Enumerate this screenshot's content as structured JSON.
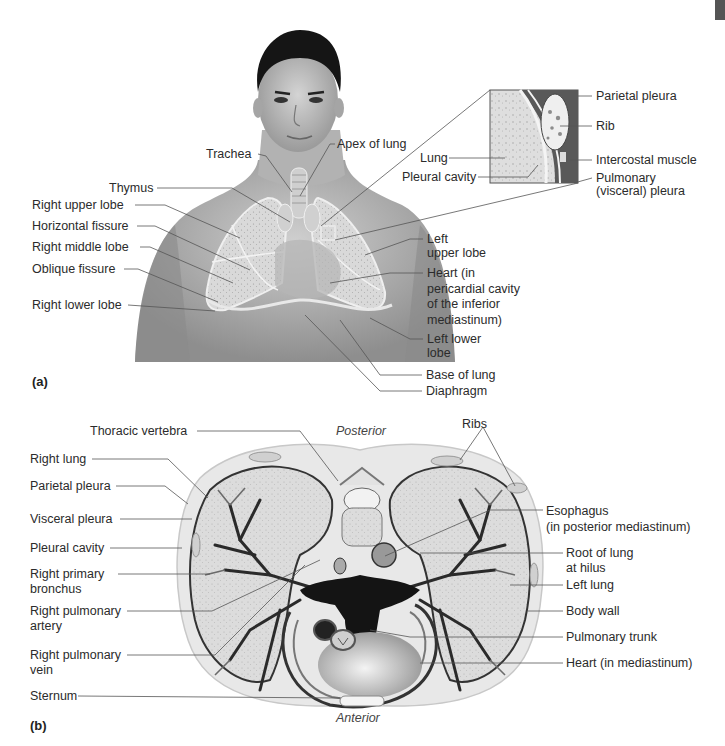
{
  "figure": {
    "panel_a": {
      "tag": "(a)",
      "labels_left": [
        {
          "id": "trachea",
          "text": "Trachea"
        },
        {
          "id": "thymus",
          "text": "Thymus"
        },
        {
          "id": "right_upper_lobe",
          "text": "Right upper lobe"
        },
        {
          "id": "horizontal_fissure",
          "text": "Horizontal fissure"
        },
        {
          "id": "right_middle_lobe",
          "text": "Right middle lobe"
        },
        {
          "id": "oblique_fissure",
          "text": "Oblique fissure"
        },
        {
          "id": "right_lower_lobe",
          "text": "Right lower lobe"
        }
      ],
      "labels_right": [
        {
          "id": "apex_of_lung",
          "text": "Apex of lung"
        },
        {
          "id": "left_upper_lobe",
          "lines": [
            "Left",
            "upper lobe"
          ]
        },
        {
          "id": "heart",
          "lines": [
            "Heart (in",
            "pericardial cavity",
            "of the inferior",
            "mediastinum)"
          ]
        },
        {
          "id": "left_lower_lobe",
          "lines": [
            "Left lower",
            "lobe"
          ]
        },
        {
          "id": "base_of_lung",
          "text": "Base of lung"
        },
        {
          "id": "diaphragm",
          "text": "Diaphragm"
        }
      ],
      "inset": {
        "labels_left": [
          {
            "id": "lung",
            "text": "Lung"
          },
          {
            "id": "pleural_cavity",
            "text": "Pleural cavity"
          }
        ],
        "labels_right": [
          {
            "id": "parietal_pleura",
            "text": "Parietal pleura"
          },
          {
            "id": "rib",
            "text": "Rib"
          },
          {
            "id": "intercostal_muscle",
            "text": "Intercostal muscle"
          },
          {
            "id": "pulmonary_pleura",
            "lines": [
              "Pulmonary",
              "(visceral) pleura"
            ]
          }
        ]
      }
    },
    "panel_b": {
      "tag": "(b)",
      "orientation_top": "Posterior",
      "orientation_bottom": "Anterior",
      "labels_top": [
        {
          "id": "thoracic_vertebra",
          "text": "Thoracic vertebra"
        },
        {
          "id": "ribs",
          "text": "Ribs"
        }
      ],
      "labels_left": [
        {
          "id": "right_lung",
          "text": "Right lung"
        },
        {
          "id": "parietal_pleura",
          "text": "Parietal pleura"
        },
        {
          "id": "visceral_pleura",
          "text": "Visceral pleura"
        },
        {
          "id": "pleural_cavity",
          "text": "Pleural cavity"
        },
        {
          "id": "right_primary_bronchus",
          "lines": [
            "Right primary",
            "bronchus"
          ]
        },
        {
          "id": "right_pulmonary_artery",
          "lines": [
            "Right pulmonary",
            "artery"
          ]
        },
        {
          "id": "right_pulmonary_vein",
          "lines": [
            "Right pulmonary",
            "vein"
          ]
        },
        {
          "id": "sternum",
          "text": "Sternum"
        }
      ],
      "labels_right": [
        {
          "id": "esophagus",
          "lines": [
            "Esophagus",
            "(in posterior mediastinum)"
          ]
        },
        {
          "id": "root_of_lung",
          "lines": [
            "Root of lung",
            "at hilus"
          ]
        },
        {
          "id": "left_lung",
          "text": "Left lung"
        },
        {
          "id": "body_wall",
          "text": "Body wall"
        },
        {
          "id": "pulmonary_trunk",
          "text": "Pulmonary trunk"
        },
        {
          "id": "heart_mediastinum",
          "text": "Heart (in mediastinum)"
        }
      ]
    }
  },
  "colors": {
    "text": "#2b2b2b",
    "leader_line": "#555555",
    "skin": "#b8b8b8",
    "lung_fill": "#d6d6d6",
    "body_wall": "#e4e4e4",
    "vessel_dark": "#1a1a1a"
  }
}
